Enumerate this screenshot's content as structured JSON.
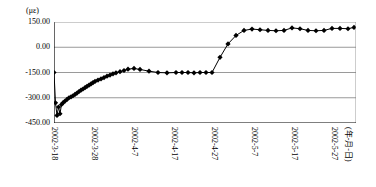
{
  "chart_data": {
    "type": "line",
    "title": "",
    "subtitle": "",
    "unit_label": "(με)",
    "xlabel": "(年-月-日)",
    "ylabel": "",
    "ylim": [
      -450,
      150
    ],
    "yticks": [
      150,
      0,
      -150,
      -300,
      -450
    ],
    "ytick_labels": [
      "150.00",
      "0.00",
      "-150.00",
      "-300.00",
      "-450.00"
    ],
    "grid": true,
    "grid_axis": "y",
    "legend": "none",
    "marker": "diamond",
    "line_color": "#000000",
    "marker_color": "#000000",
    "grid_color": "#808080",
    "axis_color": "#000000",
    "xticks": [
      "2002-3-18",
      "2002-3-28",
      "2002-4-7",
      "2002-4-17",
      "2002-4-27",
      "2002-5-7",
      "2002-5-17",
      "2002-5-27"
    ],
    "xtick_positions": [
      0,
      40,
      80,
      120,
      160,
      200,
      240,
      280
    ],
    "xlim": [
      0,
      302
    ],
    "series": [
      {
        "name": "strain",
        "x": [
          0,
          1.5,
          3,
          4.5,
          6,
          7.5,
          9,
          11,
          13,
          15,
          17,
          19,
          21,
          23,
          25,
          27,
          29,
          31,
          33,
          35,
          37,
          39,
          41,
          44,
          47,
          50,
          53,
          56,
          59,
          62,
          66,
          70,
          74,
          80,
          86,
          95,
          104,
          113,
          122,
          128,
          134,
          140,
          146,
          152,
          158,
          166,
          174,
          182,
          190,
          198,
          206,
          214,
          222,
          230,
          238,
          246,
          254,
          262,
          270,
          278,
          286,
          294,
          300
        ],
        "y": [
          -150,
          -330,
          -405,
          -355,
          -395,
          -340,
          -330,
          -320,
          -310,
          -300,
          -295,
          -288,
          -280,
          -272,
          -263,
          -255,
          -248,
          -240,
          -232,
          -225,
          -218,
          -210,
          -203,
          -195,
          -188,
          -180,
          -172,
          -165,
          -158,
          -152,
          -145,
          -138,
          -130,
          -126,
          -132,
          -142,
          -150,
          -152,
          -150,
          -150,
          -150,
          -152,
          -150,
          -150,
          -150,
          -60,
          20,
          70,
          100,
          108,
          104,
          100,
          98,
          100,
          115,
          110,
          100,
          98,
          100,
          112,
          112,
          110,
          118
        ]
      }
    ]
  }
}
